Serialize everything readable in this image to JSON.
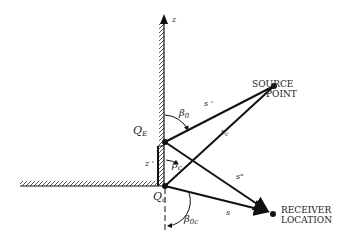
{
  "diagram": {
    "axis_label": "z",
    "labels": {
      "source": [
        "SOURCE",
        "POINT"
      ],
      "receiver": [
        "RECEIVER",
        "LOCATION"
      ],
      "qe": "Q",
      "qe_sub": "E",
      "qc": "Q",
      "qc_sub": "c",
      "z_prime": "z '",
      "beta0": "β",
      "beta0_sub": "0",
      "betac": "β",
      "betac_sub": "c",
      "beta0c": "β",
      "beta0c_sub": "0c",
      "s_prime": "s '",
      "s_c": "s",
      "s_c_sub": "c",
      "s_dprime": "s\"",
      "s": "s"
    },
    "colors": {
      "ink": "#111111",
      "background": "#ffffff"
    }
  }
}
